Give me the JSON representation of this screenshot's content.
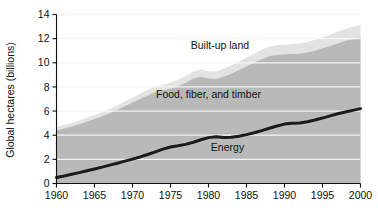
{
  "chart_data": {
    "type": "area",
    "title": "",
    "subtitle": "",
    "xlabel": "",
    "ylabel": "Global hectares (billions)",
    "xlim": [
      1960,
      2000
    ],
    "ylim": [
      0,
      14
    ],
    "grid": true,
    "legend_position": "inline-annotations",
    "xticks": [
      1960,
      1965,
      1970,
      1975,
      1980,
      1985,
      1990,
      1995,
      2000
    ],
    "yticks": [
      0,
      2,
      4,
      6,
      8,
      10,
      12,
      14
    ],
    "x": [
      1960,
      1961,
      1962,
      1963,
      1964,
      1965,
      1966,
      1967,
      1968,
      1969,
      1970,
      1971,
      1972,
      1973,
      1974,
      1975,
      1976,
      1977,
      1978,
      1979,
      1980,
      1981,
      1982,
      1983,
      1984,
      1985,
      1986,
      1987,
      1988,
      1989,
      1990,
      1991,
      1992,
      1993,
      1994,
      1995,
      1996,
      1997,
      1998,
      1999,
      2000
    ],
    "series": [
      {
        "name": "Energy",
        "color": "#1b1b1b",
        "render": "line-on-stack-bottom",
        "values": [
          0.5,
          0.62,
          0.76,
          0.9,
          1.05,
          1.2,
          1.36,
          1.52,
          1.68,
          1.85,
          2.02,
          2.2,
          2.4,
          2.62,
          2.85,
          3.02,
          3.12,
          3.24,
          3.42,
          3.62,
          3.8,
          3.88,
          3.82,
          3.84,
          3.92,
          4.05,
          4.2,
          4.38,
          4.58,
          4.76,
          4.92,
          5.0,
          5.02,
          5.12,
          5.26,
          5.42,
          5.6,
          5.78,
          5.92,
          6.06,
          6.2
        ]
      },
      {
        "name": "Food, fiber, and timber",
        "color": "#b9b9b9",
        "render": "stack-band",
        "cumulative_top": [
          4.4,
          4.55,
          4.72,
          4.9,
          5.12,
          5.35,
          5.58,
          5.82,
          6.1,
          6.4,
          6.7,
          7.0,
          7.3,
          7.55,
          7.7,
          7.85,
          8.05,
          8.35,
          8.7,
          8.85,
          8.7,
          8.65,
          8.85,
          9.1,
          9.4,
          9.7,
          10.0,
          10.3,
          10.55,
          10.65,
          10.7,
          10.72,
          10.75,
          10.85,
          11.0,
          11.2,
          11.4,
          11.6,
          11.8,
          11.95,
          12.1
        ]
      },
      {
        "name": "Built-up land",
        "color": "#e3e3e3",
        "render": "stack-band",
        "cumulative_top": [
          4.7,
          4.85,
          5.02,
          5.22,
          5.45,
          5.68,
          5.92,
          6.18,
          6.48,
          6.8,
          7.12,
          7.44,
          7.76,
          8.02,
          8.18,
          8.35,
          8.58,
          8.9,
          9.28,
          9.45,
          9.3,
          9.28,
          9.5,
          9.78,
          10.1,
          10.42,
          10.75,
          11.08,
          11.35,
          11.45,
          11.5,
          11.55,
          11.6,
          11.72,
          11.9,
          12.12,
          12.35,
          12.58,
          12.8,
          12.98,
          13.15
        ]
      }
    ],
    "annotations": [
      {
        "text": "Built-up land",
        "x": 1981.5,
        "y": 11.4,
        "name": "built-up-land-label"
      },
      {
        "text": "Food, fiber, and timber",
        "x": 1980.0,
        "y": 7.35,
        "name": "food-fiber-timber-label"
      },
      {
        "text": "Energy",
        "x": 1982.5,
        "y": 3.0,
        "name": "energy-label"
      }
    ],
    "colors": {
      "built_up_land": "#e3e3e3",
      "food_fiber_timber": "#b9b9b9",
      "energy_line": "#1b1b1b",
      "background": "#ffffff",
      "gridline": "#f4f4f4",
      "axis": "#111111",
      "plot_outside": "#d0d0d0"
    }
  },
  "axis": {
    "y_title": "Global hectares (billions)",
    "y_tick_labels": [
      "0",
      "2",
      "4",
      "6",
      "8",
      "10",
      "12",
      "14"
    ],
    "x_tick_labels": [
      "1960",
      "1965",
      "1970",
      "1975",
      "1980",
      "1985",
      "1990",
      "1995",
      "2000"
    ]
  }
}
